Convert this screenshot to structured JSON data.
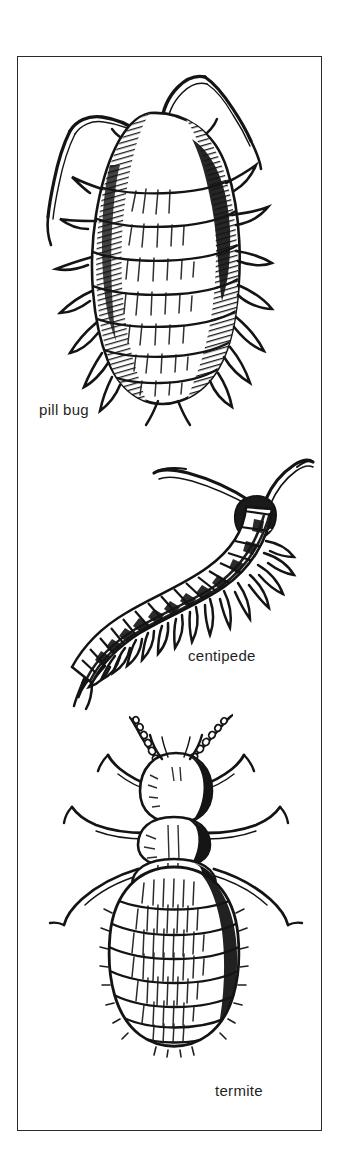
{
  "plate": {
    "kind": "line-art-illustration-plate",
    "medium": "pen-and-ink hatched drawing",
    "background_color": "#ffffff",
    "border_color": "#2b2b2b",
    "ink_color": "#1a1a1a",
    "label_color": "#1f1f1f",
    "figure_count": 3,
    "arrangement": "single vertical column"
  },
  "figures": [
    {
      "id": "pill-bug",
      "label": "pill bug",
      "common_name": "pill bug",
      "order": 1,
      "position": "top",
      "orientation": "dorsal view, head toward upper-left",
      "segments": 9,
      "antennae": 2,
      "leg_pairs": 7,
      "label_position": "below-left of figure"
    },
    {
      "id": "centipede",
      "label": "centipede",
      "common_name": "centipede",
      "order": 2,
      "position": "middle",
      "orientation": "dorsal view, body curved in an arc, head toward upper-right",
      "segments": 18,
      "antennae": 2,
      "leg_pairs": 18,
      "label_position": "right of figure"
    },
    {
      "id": "termite",
      "label": "termite",
      "common_name": "termite",
      "order": 3,
      "position": "bottom",
      "orientation": "dorsal view, head toward top",
      "segments": 10,
      "antennae": 2,
      "leg_pairs": 3,
      "label_position": "below-right of figure"
    }
  ]
}
